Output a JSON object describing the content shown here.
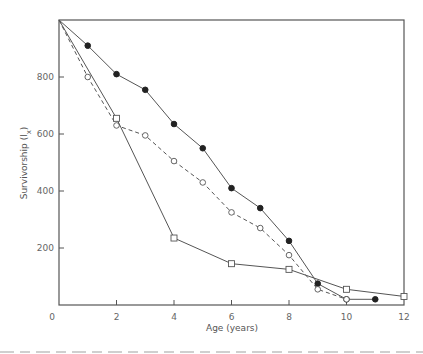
{
  "chart_data": {
    "type": "line",
    "title": "",
    "xlabel": "Age (years)",
    "ylabel": "Survivorship (lx)",
    "xlim": [
      0,
      12
    ],
    "ylim": [
      0,
      1000
    ],
    "xticks": [
      0,
      2,
      4,
      6,
      8,
      10,
      12
    ],
    "yticks": [
      200,
      400,
      600,
      800
    ],
    "grid": false,
    "legend": null,
    "series": [
      {
        "name": "filled circles",
        "marker": "filled-circle",
        "line": "solid",
        "x": [
          0,
          1,
          2,
          3,
          4,
          5,
          6,
          7,
          8,
          9,
          10,
          11
        ],
        "y": [
          1000,
          910,
          810,
          755,
          635,
          550,
          410,
          340,
          225,
          75,
          20,
          20
        ]
      },
      {
        "name": "open circles",
        "marker": "open-circle",
        "line": "dashed",
        "x": [
          0,
          1,
          2,
          3,
          4,
          5,
          6,
          7,
          8,
          9,
          10
        ],
        "y": [
          1000,
          800,
          630,
          595,
          505,
          430,
          325,
          270,
          175,
          55,
          20
        ]
      },
      {
        "name": "open squares",
        "marker": "open-square",
        "line": "solid",
        "x": [
          0,
          2,
          4,
          6,
          8,
          10,
          12
        ],
        "y": [
          1000,
          655,
          235,
          145,
          125,
          55,
          30
        ]
      }
    ]
  },
  "axes": {
    "x_label": "Age (years)",
    "y_label": "Survivorship (lx)",
    "x_tick_labels": [
      "0",
      "2",
      "4",
      "6",
      "8",
      "10",
      "12"
    ],
    "y_tick_labels": [
      "200",
      "400",
      "600",
      "800"
    ]
  }
}
